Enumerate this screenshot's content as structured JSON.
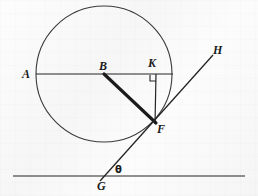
{
  "figure": {
    "width": 258,
    "height": 196,
    "background_color": "#fbfbfb",
    "ink_color": "#1b1b1b",
    "stroke_color": "#333333"
  },
  "labels": {
    "a": "A",
    "b": "B",
    "k": "K",
    "f": "F",
    "g": "G",
    "h": "H",
    "theta": "θ"
  },
  "geometry": {
    "circle": {
      "cx": 104,
      "cy": 74,
      "r": 68
    },
    "points": {
      "A": {
        "x": 36,
        "y": 74
      },
      "B": {
        "x": 104,
        "y": 74
      },
      "K": {
        "x": 156,
        "y": 74
      },
      "F": {
        "x": 155,
        "y": 122
      },
      "G": {
        "x": 103,
        "y": 176
      },
      "H": {
        "x": 213,
        "y": 55
      }
    },
    "segments": [
      {
        "name": "AK",
        "from": "A",
        "to": "K",
        "weight": "thin"
      },
      {
        "name": "BF",
        "from": "B",
        "to": "F",
        "weight": "thick"
      },
      {
        "name": "KF",
        "from": "K",
        "to": "F",
        "weight": "thin"
      },
      {
        "name": "GH",
        "from": "G",
        "to": "H",
        "weight": "thin"
      }
    ],
    "baseline": {
      "x1": 13,
      "y1": 176,
      "x2": 245,
      "y2": 176
    },
    "right_angle": {
      "at": "K",
      "x": 155,
      "y": 75,
      "size": 6
    }
  },
  "label_positions": {
    "A": {
      "left": 22,
      "top": 68
    },
    "B": {
      "left": 99,
      "top": 60
    },
    "K": {
      "left": 148,
      "top": 57
    },
    "F": {
      "left": 157,
      "top": 123
    },
    "G": {
      "left": 97,
      "top": 180
    },
    "H": {
      "left": 213,
      "top": 44
    },
    "theta": {
      "left": 115,
      "top": 165
    }
  }
}
